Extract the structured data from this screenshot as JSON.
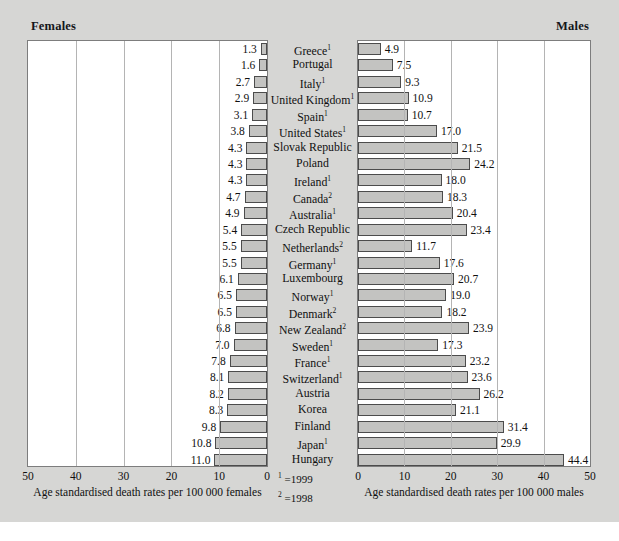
{
  "header": {
    "left_label": "Females",
    "right_label": "Males"
  },
  "axis": {
    "left_title": "Age standardised death rates per 100 000 females",
    "right_title": "Age standardised death rates per 100 000 males",
    "left_ticks": [
      "50",
      "40",
      "30",
      "20",
      "10",
      "0"
    ],
    "right_ticks": [
      "0",
      "10",
      "20",
      "30",
      "40",
      "50"
    ],
    "max": 50
  },
  "footnotes": [
    {
      "marker": "1",
      "text": "=1999"
    },
    {
      "marker": "2",
      "text": "=1998"
    }
  ],
  "colors": {
    "background": "#d6d6d4",
    "panel": "#ffffff",
    "bar_fill": "#c3c3c1",
    "bar_stroke": "#4c4c4c",
    "gridline": "#b4b4b4",
    "text": "#101010"
  },
  "caption": "",
  "chart_data": {
    "type": "bar",
    "title": "",
    "subtitle": "",
    "orientation": "horizontal",
    "style": "population-pyramid",
    "xlabel_left": "Age standardised death rates per 100 000 females",
    "xlabel_right": "Age standardised death rates per 100 000 males",
    "ylabel": "",
    "xlim": [
      0,
      50
    ],
    "grid": true,
    "legend": "none",
    "categories": [
      "Greece",
      "Portugal",
      "Italy",
      "United Kingdom",
      "Spain",
      "United States",
      "Slovak Republic",
      "Poland",
      "Ireland",
      "Canada",
      "Australia",
      "Czech Republic",
      "Netherlands",
      "Germany",
      "Luxembourg",
      "Norway",
      "Denmark",
      "New Zealand",
      "Sweden",
      "France",
      "Switzerland",
      "Austria",
      "Korea",
      "Finland",
      "Japan",
      "Hungary"
    ],
    "category_footnotes": [
      "1",
      "",
      "1",
      "1",
      "1",
      "1",
      "",
      "",
      "1",
      "2",
      "1",
      "",
      "2",
      "1",
      "",
      "1",
      "2",
      "2",
      "1",
      "1",
      "1",
      "",
      "",
      "",
      "1",
      ""
    ],
    "series": [
      {
        "name": "Females",
        "values": [
          1.3,
          1.6,
          2.7,
          2.9,
          3.1,
          3.8,
          4.3,
          4.3,
          4.3,
          4.7,
          4.9,
          5.4,
          5.5,
          5.5,
          6.1,
          6.5,
          6.5,
          6.8,
          7.0,
          7.8,
          8.1,
          8.2,
          8.3,
          9.8,
          10.8,
          11.0
        ]
      },
      {
        "name": "Males",
        "values": [
          4.9,
          7.5,
          9.3,
          10.9,
          10.7,
          17.0,
          21.5,
          24.2,
          18.0,
          18.3,
          20.4,
          23.4,
          11.7,
          17.6,
          20.7,
          19.0,
          18.2,
          23.9,
          17.3,
          23.2,
          23.6,
          26.2,
          21.1,
          31.4,
          29.9,
          44.4
        ]
      }
    ]
  }
}
